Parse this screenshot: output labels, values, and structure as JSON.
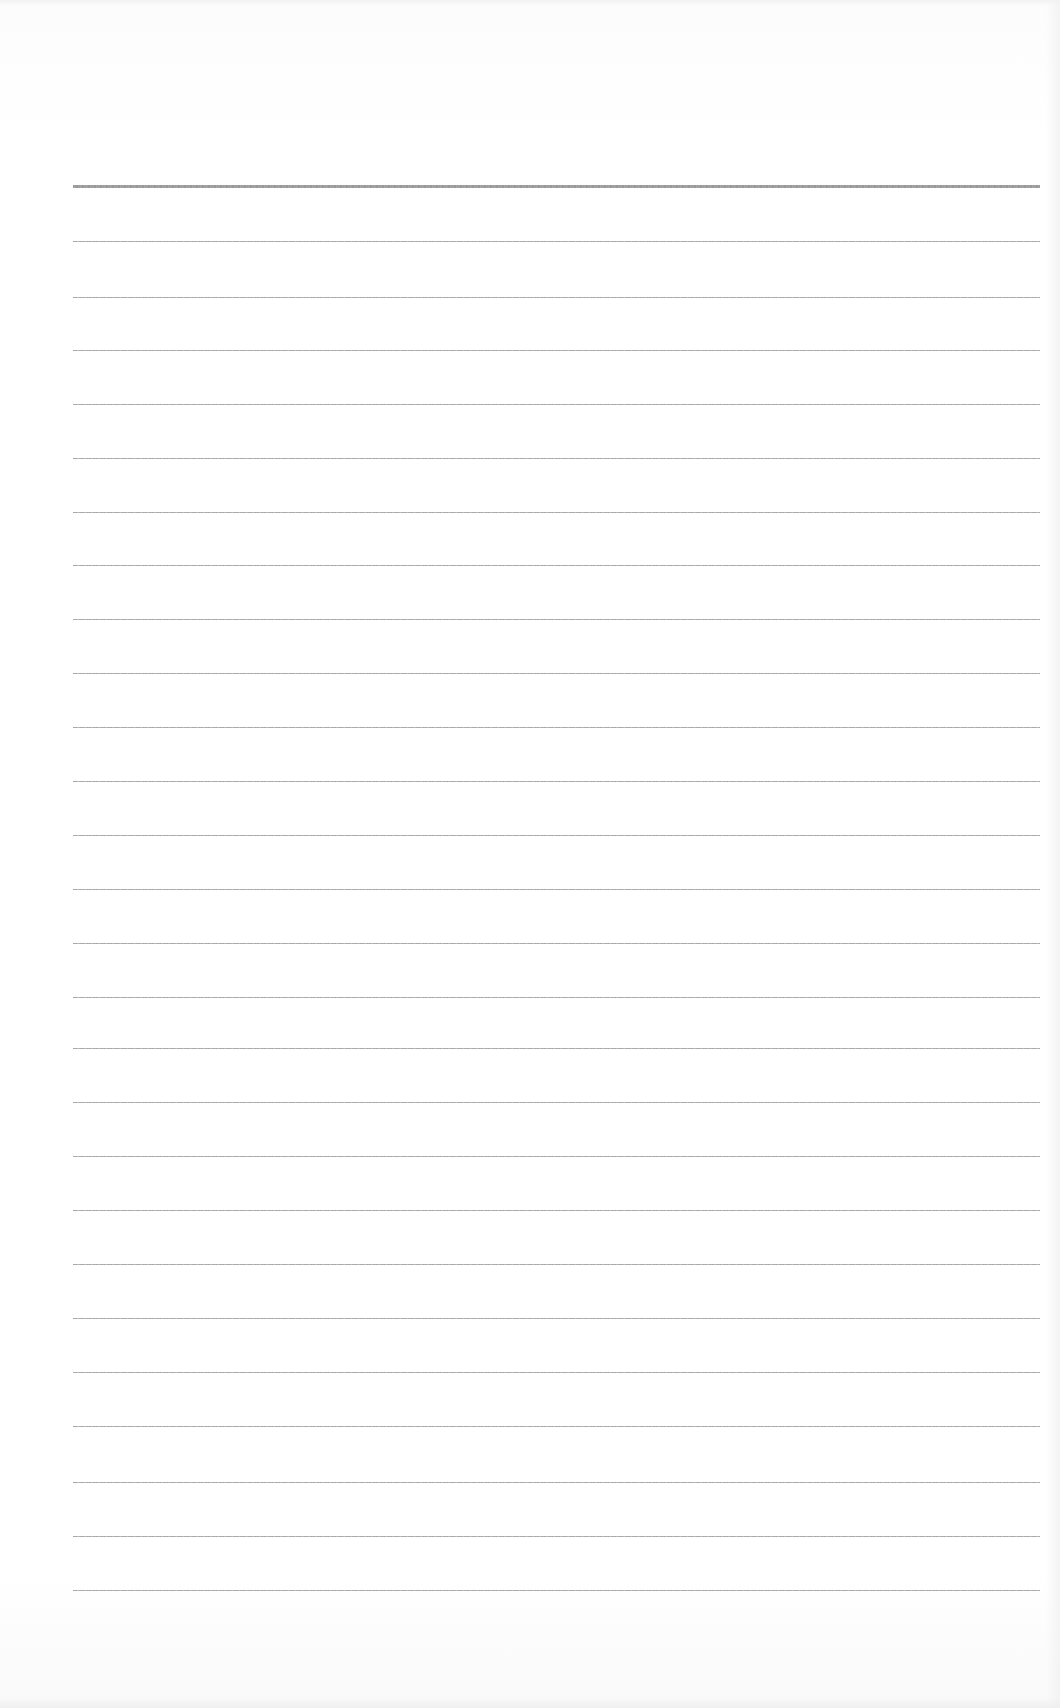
{
  "document": {
    "type": "ruled-paper",
    "background_color": "#ffffff",
    "line_color": "#9a9a9a",
    "rule_left_px": 73,
    "rule_right_px": 1040,
    "header_rule": {
      "y": 185,
      "thickness": 3
    },
    "rules_y": [
      241,
      297,
      350,
      404,
      458,
      512,
      565,
      619,
      673,
      727,
      781,
      835,
      889,
      943,
      997,
      1048,
      1102,
      1156,
      1210,
      1264,
      1318,
      1372,
      1426,
      1482,
      1536,
      1590
    ],
    "rule_count": 27,
    "text_content": ""
  }
}
